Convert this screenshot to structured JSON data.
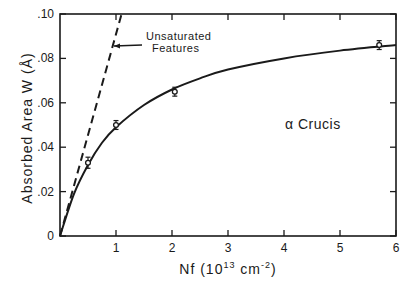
{
  "chart_data": {
    "type": "line",
    "title": "",
    "xlabel": "Nf (10^13 cm^-2)",
    "xlabel_parts": {
      "main": "Nf  (10",
      "sup1": "13",
      "mid": " cm",
      "sup2": "-2",
      "end": ")"
    },
    "ylabel": "Absorbed Area W (Å)",
    "xlim": [
      0,
      6
    ],
    "ylim": [
      0,
      0.1
    ],
    "x_ticks": [
      "1",
      "2",
      "3",
      "4",
      "5",
      "6"
    ],
    "y_ticks": [
      "0",
      ".02",
      ".04",
      ".06",
      ".08",
      ".10"
    ],
    "grid": false,
    "legend": null,
    "annotations": [
      {
        "text_line1": "Unsaturated",
        "text_line2": "Features",
        "points_to": "dashed line"
      },
      {
        "text": "α Crucis"
      }
    ],
    "series": [
      {
        "name": "Unsaturated Features (linear)",
        "style": "dashed",
        "x": [
          0,
          1.1
        ],
        "y": [
          0,
          0.1
        ]
      },
      {
        "name": "Curve of growth",
        "style": "solid",
        "x": [
          0,
          0.25,
          0.5,
          0.75,
          1.0,
          1.5,
          2.0,
          2.5,
          3.0,
          4.0,
          5.0,
          6.0
        ],
        "y": [
          0,
          0.019,
          0.032,
          0.042,
          0.049,
          0.059,
          0.066,
          0.071,
          0.075,
          0.08,
          0.0835,
          0.086
        ]
      },
      {
        "name": "Observations",
        "style": "points-with-errorbars",
        "x": [
          0.5,
          1.0,
          2.05,
          5.7
        ],
        "y": [
          0.033,
          0.05,
          0.065,
          0.086
        ],
        "yerr": [
          0.0025,
          0.002,
          0.002,
          0.002
        ]
      }
    ]
  }
}
